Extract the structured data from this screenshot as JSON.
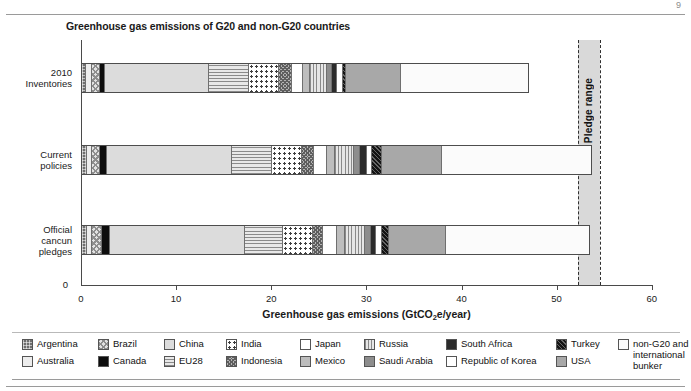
{
  "page": {
    "corner_mark": "9"
  },
  "chart_data": {
    "type": "bar",
    "orientation": "horizontal",
    "stacked": true,
    "title": "Greenhouse gas emissions of G20 and non-G20 countries",
    "xlabel": "Greenhouse gas emissions (GtCO2e/year)",
    "xlabel_parts": {
      "pre": "Greenhouse gas emissions (GtCO",
      "sub": "2",
      "post": "e/year)"
    },
    "ylabel": "",
    "xlim": [
      0,
      60
    ],
    "xticks": [
      0,
      10,
      20,
      30,
      40,
      50,
      60
    ],
    "xticklabels": [
      "0",
      "10",
      "20",
      "30",
      "40",
      "50",
      "60"
    ],
    "ytick_zero": "0",
    "grid": false,
    "legend_position": "bottom",
    "categories": [
      "2010 Inventories",
      "Current policies",
      "Official cancun pledges"
    ],
    "category_lines": [
      [
        "2010",
        "Inventories"
      ],
      [
        "Current",
        "policies"
      ],
      [
        "Official",
        "cancun",
        "pledges"
      ]
    ],
    "series": [
      {
        "name": "Argentina",
        "pattern": "p-argentina",
        "values": [
          0.35,
          0.42,
          0.4
        ]
      },
      {
        "name": "Australia",
        "pattern": "p-australia",
        "values": [
          0.55,
          0.58,
          0.6
        ]
      },
      {
        "name": "Brazil",
        "pattern": "p-brazil",
        "values": [
          0.85,
          0.84,
          1.05
        ]
      },
      {
        "name": "Canada",
        "pattern": "p-canada",
        "values": [
          0.62,
          0.7,
          0.82
        ]
      },
      {
        "name": "China",
        "pattern": "p-china",
        "values": [
          10.95,
          13.2,
          14.2
        ]
      },
      {
        "name": "EU28",
        "pattern": "p-eu28",
        "values": [
          4.25,
          4.2,
          4.0
        ]
      },
      {
        "name": "India",
        "pattern": "p-india",
        "values": [
          3.15,
          3.2,
          3.25
        ]
      },
      {
        "name": "Indonesia",
        "pattern": "p-indonesia",
        "values": [
          1.35,
          1.25,
          1.0
        ]
      },
      {
        "name": "Japan",
        "pattern": "p-japan",
        "values": [
          1.15,
          1.35,
          1.45
        ]
      },
      {
        "name": "Mexico",
        "pattern": "p-mexico",
        "values": [
          0.75,
          0.85,
          0.9
        ]
      },
      {
        "name": "Russia",
        "pattern": "p-russia",
        "values": [
          1.8,
          2.0,
          2.05
        ]
      },
      {
        "name": "Saudi Arabia",
        "pattern": "p-saudi",
        "values": [
          0.52,
          0.63,
          0.68
        ]
      },
      {
        "name": "South Africa",
        "pattern": "p-southafrica",
        "values": [
          0.52,
          0.74,
          0.55
        ]
      },
      {
        "name": "Republic of Korea",
        "pattern": "p-korea",
        "values": [
          0.63,
          0.53,
          0.6
        ]
      },
      {
        "name": "Turkey",
        "pattern": "p-turkey",
        "values": [
          0.33,
          1.05,
          0.75
        ]
      },
      {
        "name": "USA",
        "pattern": "p-usa",
        "values": [
          5.8,
          6.3,
          6.0
        ]
      },
      {
        "name": "non-G20 and international bunker",
        "pattern": "p-nong20",
        "values": [
          13.55,
          15.86,
          15.25
        ]
      }
    ],
    "totals": [
      47.2,
      53.3,
      53.5
    ],
    "annotations": [
      {
        "label": "Pledge range",
        "type": "vertical-band",
        "range": [
          52.2,
          54.6
        ]
      }
    ]
  },
  "legend": {
    "columns": [
      [
        {
          "label": "Argentina",
          "pattern": "p-argentina"
        },
        {
          "label": "Australia",
          "pattern": "p-australia"
        }
      ],
      [
        {
          "label": "Brazil",
          "pattern": "p-brazil"
        },
        {
          "label": "Canada",
          "pattern": "p-canada"
        }
      ],
      [
        {
          "label": "China",
          "pattern": "p-china"
        },
        {
          "label": "EU28",
          "pattern": "p-eu28"
        }
      ],
      [
        {
          "label": "India",
          "pattern": "p-india"
        },
        {
          "label": "Indonesia",
          "pattern": "p-indonesia"
        }
      ],
      [
        {
          "label": "Japan",
          "pattern": "p-japan"
        },
        {
          "label": "Mexico",
          "pattern": "p-mexico"
        }
      ],
      [
        {
          "label": "Russia",
          "pattern": "p-russia"
        },
        {
          "label": "Saudi Arabia",
          "pattern": "p-saudi"
        }
      ],
      [
        {
          "label": "South Africa",
          "pattern": "p-southafrica"
        },
        {
          "label": "Republic of Korea",
          "pattern": "p-korea"
        }
      ],
      [
        {
          "label": "Turkey",
          "pattern": "p-turkey"
        },
        {
          "label": "USA",
          "pattern": "p-usa"
        }
      ],
      [
        {
          "label": "non-G20 and international bunker",
          "pattern": "p-nong20",
          "wrap": true
        }
      ]
    ]
  }
}
